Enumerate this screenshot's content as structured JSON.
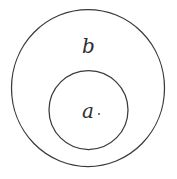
{
  "diagram": {
    "type": "venn-subset",
    "background_color": "#ffffff",
    "stroke_color": "#3a3a3a",
    "label_color": "#2e2e2e",
    "outer_set": {
      "label": "b",
      "center_x": 88,
      "center_y": 88,
      "radius": 77,
      "stroke_width": 1.3,
      "fill": "none",
      "label_x": 88,
      "label_y": 46
    },
    "inner_set": {
      "label": "a",
      "center_x": 88,
      "center_y": 110,
      "radius": 40,
      "stroke_width": 1.3,
      "fill": "none",
      "label_x": 88,
      "label_y": 111
    },
    "mark": {
      "name": "stray-dot",
      "x": 98,
      "y": 113,
      "size": 2
    },
    "relation": "a is a subset of b"
  },
  "chart_data": {
    "type": "diagram",
    "subtype": "euler-venn",
    "sets": [
      {
        "name": "b",
        "role": "outer",
        "cx": 88,
        "cy": 88,
        "r": 77,
        "contains": [
          "a"
        ]
      },
      {
        "name": "a",
        "role": "inner",
        "cx": 88,
        "cy": 110,
        "r": 40,
        "contains": []
      }
    ],
    "labels": [
      "b",
      "a"
    ],
    "relations": [
      {
        "subset": "a",
        "superset": "b"
      }
    ],
    "grid": false,
    "legend": "none"
  }
}
